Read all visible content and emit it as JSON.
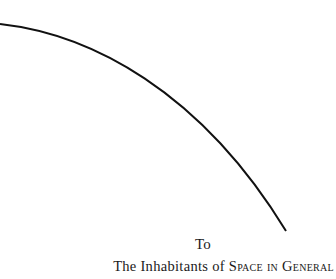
{
  "dedication": {
    "to": "To",
    "line_prefix": "The Inhabitants of ",
    "line_smallcaps": "Space in General"
  },
  "figure": {
    "type": "arc",
    "stroke": "#111111"
  }
}
